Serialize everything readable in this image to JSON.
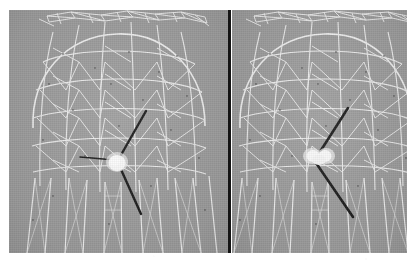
{
  "figure": {
    "kind": "side-by-side-comparison",
    "caption": "",
    "background_color": "#ffffff",
    "plate_color": "#9e9e9e",
    "mesh_line_color": "#f2f2f2",
    "marker_line_color": "#1a1a1a",
    "blob_color": "#fbfbfb",
    "divider_color": "#141414",
    "panel_count": 2
  },
  "panels": [
    {
      "id": "left",
      "label": "",
      "x": 9,
      "y": 10,
      "width": 219,
      "height": 243,
      "blob": {
        "cx": 108,
        "cy": 152,
        "rx": 9,
        "ry": 9,
        "shape": "round"
      },
      "markers": [
        {
          "name": "needle-upper-right",
          "x1": 108,
          "y1": 152,
          "x2": 137,
          "y2": 101,
          "width": 2.4
        },
        {
          "name": "needle-horizontal-left",
          "x1": 106,
          "y1": 150,
          "x2": 71,
          "y2": 147,
          "width": 1.6
        },
        {
          "name": "needle-lower-right",
          "x1": 110,
          "y1": 155,
          "x2": 132,
          "y2": 204,
          "width": 2.4
        }
      ]
    },
    {
      "id": "right",
      "label": "",
      "x": 232,
      "y": 10,
      "width": 175,
      "height": 243,
      "blob": {
        "cx": 88,
        "cy": 145,
        "rx": 12,
        "ry": 9,
        "shape": "double-lobe"
      },
      "markers": [
        {
          "name": "needle-upper-right",
          "x1": 84,
          "y1": 148,
          "x2": 116,
          "y2": 98,
          "width": 2.6
        },
        {
          "name": "needle-lower-right",
          "x1": 82,
          "y1": 150,
          "x2": 121,
          "y2": 207,
          "width": 2.6
        }
      ]
    }
  ],
  "mesh": {
    "description": "triangulated wireframe dome with vertical strands below",
    "crown_label": "crown-ring",
    "dome_label": "triangulated-dome",
    "skirt_label": "vertical-strands"
  }
}
